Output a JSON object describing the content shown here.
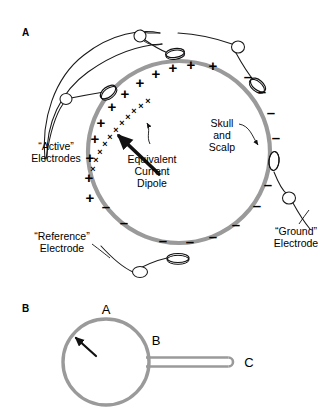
{
  "figure": {
    "background_color": "#ffffff",
    "head_stroke_color": "#9a9a9a",
    "wire_stroke_color": "#1a1a1a",
    "text_color": "#000000",
    "panels": [
      {
        "id": "A",
        "label": "A",
        "label_x": 22,
        "label_y": 36,
        "head": {
          "cx": 179,
          "cy": 152,
          "r": 91,
          "stroke_width": 4.2
        },
        "annotations": [
          {
            "name": "active-electrodes",
            "lines": [
              "“Active”",
              "Electrodes"
            ],
            "x": 56,
            "y": 150,
            "anchor": "middle",
            "line_height": 12
          },
          {
            "name": "equivalent-current-dipole",
            "lines": [
              "Equivalent",
              "Current",
              "Dipole"
            ],
            "x": 152,
            "y": 163,
            "anchor": "middle",
            "line_height": 12
          },
          {
            "name": "skull-and-scalp",
            "lines": [
              "Skull",
              "and",
              "Scalp"
            ],
            "x": 222,
            "y": 127,
            "anchor": "middle",
            "line_height": 12
          },
          {
            "name": "ground-electrode",
            "lines": [
              "“Ground”",
              "Electrode"
            ],
            "x": 296,
            "y": 235,
            "anchor": "middle",
            "line_height": 12
          },
          {
            "name": "reference-electrode",
            "lines": [
              "“Reference”",
              "Electrode"
            ],
            "x": 62,
            "y": 240,
            "anchor": "middle",
            "line_height": 12
          }
        ],
        "positive_charges": {
          "symbol": "+",
          "font_size": 15,
          "count": 12,
          "points": [
            {
              "x": 90,
              "y": 203
            },
            {
              "x": 89,
              "y": 183
            },
            {
              "x": 90,
              "y": 163
            },
            {
              "x": 95,
              "y": 144
            },
            {
              "x": 101,
              "y": 128
            },
            {
              "x": 112,
              "y": 112
            },
            {
              "x": 125,
              "y": 99
            },
            {
              "x": 140,
              "y": 88
            },
            {
              "x": 156,
              "y": 79
            },
            {
              "x": 173,
              "y": 73
            },
            {
              "x": 191,
              "y": 70
            },
            {
              "x": 213,
              "y": 71
            }
          ]
        },
        "small_crosses": {
          "symbol": "×",
          "font_size": 9,
          "count": 11,
          "points": [
            {
              "x": 93,
              "y": 172
            },
            {
              "x": 96,
              "y": 163
            },
            {
              "x": 100,
              "y": 155
            },
            {
              "x": 105,
              "y": 147
            },
            {
              "x": 110,
              "y": 140
            },
            {
              "x": 116,
              "y": 133
            },
            {
              "x": 122,
              "y": 126
            },
            {
              "x": 128,
              "y": 120
            },
            {
              "x": 134,
              "y": 114
            },
            {
              "x": 141,
              "y": 109
            },
            {
              "x": 148,
              "y": 104
            }
          ]
        },
        "negative_charges": {
          "symbol": "–",
          "font_size": 15,
          "count": 12,
          "points": [
            {
              "x": 248,
              "y": 82
            },
            {
              "x": 262,
              "y": 97
            },
            {
              "x": 271,
              "y": 118
            },
            {
              "x": 276,
              "y": 143
            },
            {
              "x": 275,
              "y": 168
            },
            {
              "x": 268,
              "y": 190
            },
            {
              "x": 257,
              "y": 211
            },
            {
              "x": 236,
              "y": 230
            },
            {
              "x": 213,
              "y": 242
            },
            {
              "x": 190,
              "y": 247
            },
            {
              "x": 163,
              "y": 246
            },
            {
              "x": 124,
              "y": 228
            }
          ]
        },
        "extra_negatives": [
          {
            "x": 106,
            "y": 212
          }
        ],
        "electrode_pads": [
          {
            "name": "electrode-pad-top-left",
            "cx": 108,
            "cy": 92,
            "rx": 9,
            "ry": 5,
            "rotate": -38
          },
          {
            "name": "electrode-pad-top-right",
            "cx": 175,
            "cy": 53,
            "rx": 9.5,
            "ry": 4.5,
            "rotate": -8
          },
          {
            "name": "electrode-pad-right-upper",
            "cx": 258,
            "cy": 85,
            "rx": 9,
            "ry": 5,
            "rotate": 40
          },
          {
            "name": "electrode-pad-right-lower",
            "cx": 274,
            "cy": 161,
            "rx": 5,
            "ry": 9.5,
            "rotate": 5
          },
          {
            "name": "electrode-pad-bottom",
            "cx": 178,
            "cy": 258,
            "rx": 11,
            "ry": 4.5,
            "rotate": 0
          }
        ],
        "wire_rings": [
          {
            "name": "wire-ring-top-left",
            "cx": 66,
            "cy": 99,
            "rx": 6,
            "ry": 5.5
          },
          {
            "name": "wire-ring-top-middle",
            "cx": 140,
            "cy": 36,
            "rx": 6,
            "ry": 6
          },
          {
            "name": "wire-ring-top-right",
            "cx": 238,
            "cy": 47,
            "rx": 6.5,
            "ry": 6
          },
          {
            "name": "wire-ring-ground",
            "cx": 289,
            "cy": 198,
            "rx": 6.5,
            "ry": 6
          },
          {
            "name": "wire-ring-reference",
            "cx": 140,
            "cy": 272,
            "rx": 7.5,
            "ry": 5.5
          }
        ],
        "dipole_arrow": {
          "name": "equivalent-current-dipole-arrow",
          "from": {
            "x": 159,
            "y": 174
          },
          "to": {
            "x": 119,
            "y": 136
          },
          "stroke_width": 3.6
        },
        "skull_pointer": {
          "name": "skull-and-scalp-pointer",
          "to": {
            "x": 264,
            "y": 146
          }
        }
      },
      {
        "id": "B",
        "label": "B",
        "label_x": 22,
        "label_y": 312,
        "sphere": {
          "cx": 106,
          "cy": 362,
          "r": 43,
          "stroke_width": 3.4
        },
        "tube": {
          "name": "tube-stem",
          "x1": 146,
          "x2": 233,
          "cy": 362,
          "half_height": 4.5,
          "stroke_width": 2.6
        },
        "node_labels": [
          {
            "name": "node-label-a",
            "text": "A",
            "x": 106,
            "y": 314
          },
          {
            "name": "node-label-b",
            "text": "B",
            "x": 156,
            "y": 345
          },
          {
            "name": "node-label-c",
            "text": "C",
            "x": 249,
            "y": 367
          }
        ],
        "arrow": {
          "name": "sphere-current-arrow",
          "from": {
            "x": 96,
            "y": 356
          },
          "to": {
            "x": 76,
            "y": 338
          },
          "stroke_width": 2.2
        }
      }
    ]
  }
}
